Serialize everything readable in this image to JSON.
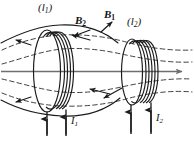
{
  "figure": {
    "type": "physics-diagram",
    "width": 194,
    "height": 144,
    "background": "#ffffff",
    "stroke_color": "#1a1a1a",
    "field_line_color": "#2b2b2b",
    "axis_color": "#6e6e6e"
  },
  "labels": {
    "loop1": {
      "text": "(l",
      "sub": "1",
      "close": ")"
    },
    "loop2": {
      "text": "(l",
      "sub": "2",
      "close": ")"
    },
    "field_b2": {
      "text": "B",
      "sub": "2"
    },
    "field_b1": {
      "text": "B",
      "sub": "1"
    },
    "current1": {
      "text": "I",
      "sub": "1"
    },
    "current2": {
      "text": "I",
      "sub": "2"
    }
  },
  "elements": {
    "coil_left_turns": 5,
    "coil_right_turns": 6,
    "dashed_field_lines": 4,
    "solid_field_lines": 2,
    "axis_arrow": "right",
    "lead_arrows_left": 2,
    "lead_arrows_right": 2,
    "field_arrow_directions": [
      "up-left",
      "up-left",
      "left",
      "left",
      "down-left",
      "left"
    ]
  }
}
